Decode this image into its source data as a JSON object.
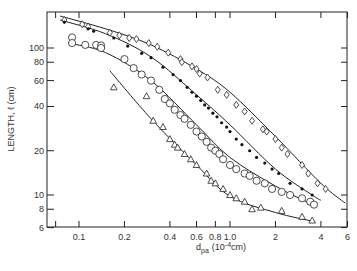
{
  "chart_data": {
    "type": "scatter",
    "title": "",
    "xlabel": "d_pa (10^-4 cm)",
    "xlabel_main": "d",
    "xlabel_sub": "pa",
    "xlabel_unit_pre": "(10",
    "xlabel_unit_exp": "-4",
    "xlabel_unit_post": "cm)",
    "ylabel": "LENGTH, ℓ (cm)",
    "xscale": "log",
    "yscale": "log",
    "xlim": [
      0.065,
      6
    ],
    "ylim": [
      6,
      180
    ],
    "grid": false,
    "x_ticks": [
      {
        "v": 0.07,
        "label": ""
      },
      {
        "v": 0.1,
        "label": "0.1"
      },
      {
        "v": 0.2,
        "label": "0.2"
      },
      {
        "v": 0.4,
        "label": "0.4"
      },
      {
        "v": 0.6,
        "label": "0.6"
      },
      {
        "v": 0.8,
        "label": "0.8"
      },
      {
        "v": 1.0,
        "label": "1.0"
      },
      {
        "v": 2,
        "label": "2"
      },
      {
        "v": 4,
        "label": "4"
      },
      {
        "v": 6,
        "label": "6"
      }
    ],
    "y_ticks": [
      {
        "v": 6,
        "label": "6"
      },
      {
        "v": 8,
        "label": "8"
      },
      {
        "v": 10,
        "label": "10"
      },
      {
        "v": 20,
        "label": "20"
      },
      {
        "v": 40,
        "label": "40"
      },
      {
        "v": 60,
        "label": "60"
      },
      {
        "v": 80,
        "label": "80"
      },
      {
        "v": 100,
        "label": "100"
      }
    ],
    "series": [
      {
        "name": "diamonds",
        "marker": "diamond",
        "x": [
          0.08,
          0.105,
          0.115,
          0.16,
          0.185,
          0.215,
          0.24,
          0.29,
          0.33,
          0.39,
          0.47,
          0.48,
          0.56,
          0.6,
          0.63,
          0.71,
          0.83,
          0.95,
          1.1,
          1.25,
          1.4,
          1.65,
          1.75,
          2.0,
          2.2,
          2.4,
          3.0,
          3.3,
          3.8,
          4.3
        ],
        "y": [
          155,
          145,
          140,
          127,
          122,
          117,
          115,
          108,
          102,
          93,
          84,
          80,
          75,
          72,
          67,
          63,
          52,
          48,
          41,
          37,
          32,
          28,
          27,
          24,
          21,
          19,
          16,
          14,
          12,
          11
        ],
        "fit": {
          "x": [
            0.075,
            0.15,
            0.3,
            0.6,
            1.0,
            2.0,
            4.0,
            5.8
          ],
          "y": [
            165,
            135,
            105,
            72,
            50,
            25,
            12,
            8.8
          ]
        }
      },
      {
        "name": "filled dots",
        "marker": "dot",
        "x": [
          0.08,
          0.115,
          0.125,
          0.17,
          0.21,
          0.26,
          0.3,
          0.36,
          0.42,
          0.47,
          0.52,
          0.56,
          0.6,
          0.64,
          0.68,
          0.72,
          0.77,
          0.82,
          0.88,
          0.95,
          1.0,
          1.1,
          1.2,
          1.35,
          1.5,
          1.7,
          1.9,
          2.1,
          2.5,
          3.0,
          3.5
        ],
        "y": [
          150,
          135,
          130,
          117,
          103,
          92,
          86,
          74,
          66,
          60,
          54,
          50,
          47,
          44,
          41,
          39,
          36,
          34,
          31,
          29,
          27,
          24,
          22,
          20,
          18,
          16.5,
          15,
          14,
          12,
          11,
          10
        ],
        "fit": {
          "x": [
            0.075,
            0.15,
            0.3,
            0.6,
            1.0,
            2.0,
            3.5,
            4.0
          ],
          "y": [
            155,
            125,
            87,
            48,
            30,
            15,
            10,
            9.2
          ]
        }
      },
      {
        "name": "open circles",
        "marker": "circle",
        "x": [
          0.09,
          0.09,
          0.11,
          0.13,
          0.14,
          0.14,
          0.2,
          0.23,
          0.26,
          0.3,
          0.34,
          0.37,
          0.4,
          0.43,
          0.47,
          0.5,
          0.55,
          0.6,
          0.65,
          0.7,
          0.75,
          0.8,
          0.85,
          0.9,
          1.0,
          1.1,
          1.25,
          1.35,
          1.5,
          1.7,
          1.9,
          2.2,
          2.5,
          3.0,
          3.4,
          3.6
        ],
        "y": [
          118,
          108,
          105,
          105,
          104,
          100,
          84,
          73,
          66,
          60,
          52,
          45,
          42,
          38,
          35,
          33,
          30,
          27,
          25,
          23,
          21,
          20,
          19,
          17.5,
          16,
          15,
          14,
          13.5,
          12.5,
          12,
          11,
          10.5,
          10,
          9.5,
          9,
          8.6
        ],
        "fit": {
          "x": [
            0.085,
            0.15,
            0.3,
            0.6,
            1.0,
            2.0,
            3.7
          ],
          "y": [
            108,
            93,
            60,
            30,
            18,
            11.5,
            8.4
          ]
        }
      },
      {
        "name": "triangles",
        "marker": "triangle",
        "x": [
          0.17,
          0.28,
          0.31,
          0.36,
          0.4,
          0.43,
          0.45,
          0.5,
          0.55,
          0.6,
          0.7,
          0.75,
          0.8,
          0.9,
          1.0,
          1.1,
          1.25,
          1.4,
          1.6,
          2.2,
          3.0,
          3.5
        ],
        "y": [
          54,
          47,
          32,
          29,
          24,
          22,
          21,
          19,
          17.5,
          16,
          14,
          12.5,
          12,
          11,
          10,
          9.5,
          9,
          8,
          8.2,
          7.8,
          7.1,
          6.7
        ],
        "fit": {
          "x": [
            0.16,
            0.3,
            0.6,
            1.0,
            2.0,
            3.6
          ],
          "y": [
            70,
            33,
            16,
            9.8,
            7.6,
            6.6
          ]
        }
      }
    ]
  }
}
